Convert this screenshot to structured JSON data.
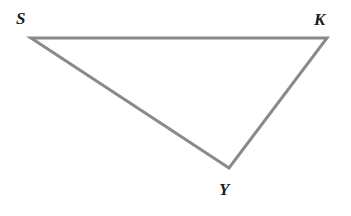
{
  "figure": {
    "kind": "geometry-diagram",
    "shape_name": "triangle",
    "background_color": "#ffffff",
    "stroke_color": "#8a8a8a",
    "stroke_width": 3,
    "label_color": "#1b1b1b",
    "width": 351,
    "height": 216
  },
  "chart_data": {
    "type": "scatter",
    "title": "",
    "subtitle": "",
    "xlabel": "",
    "ylabel": "",
    "grid": false,
    "legend": "none",
    "xlim": [
      0,
      351
    ],
    "ylim": [
      0,
      216
    ],
    "shape": "triangle",
    "vertices": [
      {
        "label": "S",
        "x": 31,
        "y": 38
      },
      {
        "label": "K",
        "x": 327,
        "y": 38
      },
      {
        "label": "Y",
        "x": 229,
        "y": 168
      }
    ],
    "edges": [
      {
        "name": "SK",
        "from": "S",
        "to": "K"
      },
      {
        "name": "KY",
        "from": "K",
        "to": "Y"
      },
      {
        "name": "YS",
        "from": "Y",
        "to": "S"
      }
    ],
    "polygon_points": "31,38 327,38 229,168",
    "annotations": []
  },
  "labels": {
    "s": "S",
    "k": "K",
    "y": "Y"
  }
}
